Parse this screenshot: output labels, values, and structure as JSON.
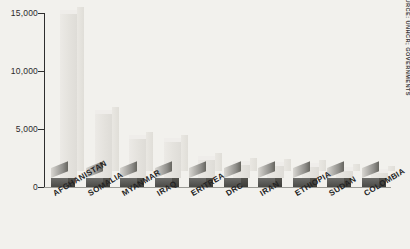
{
  "chart_data": {
    "type": "bar",
    "title": "",
    "subtitle": "",
    "xlabel": "",
    "ylabel": "",
    "categories": [
      "AFGHANISTAN",
      "SOMALIA",
      "MYANMAR",
      "IRAQ",
      "ERITREA",
      "DRC",
      "IRAN",
      "ETHIOPIA",
      "SUDAN",
      "COLOMBIA"
    ],
    "values": [
      14900,
      6300,
      4100,
      3900,
      2300,
      1900,
      1800,
      1700,
      1400,
      1200
    ],
    "ylim": [
      0,
      15000
    ],
    "yticks": [
      0,
      5000,
      10000,
      15000
    ],
    "ytick_labels": [
      "0",
      "5,000",
      "10,000",
      "15,000"
    ],
    "grid": false,
    "legend": null,
    "annotations": {
      "source": "SOURCE: UNHCR; GOVERNMENTS"
    },
    "style": {
      "background": "#f2f1ed",
      "bar_face": "#e4e2dd",
      "bar_base": "#4a4a47",
      "axis": "#2e2e2e",
      "baseline": "#9a9a95",
      "label_color": "#232323"
    }
  }
}
